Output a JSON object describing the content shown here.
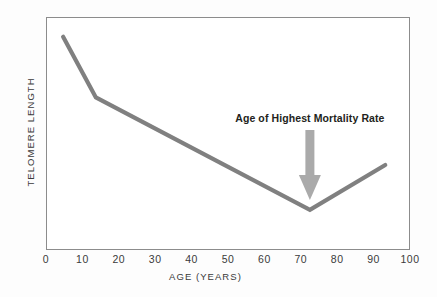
{
  "chart_data": {
    "type": "line",
    "title": "",
    "xlabel": "AGE (YEARS)",
    "ylabel": "TELOMERE LENGTH",
    "xlim": [
      0,
      100
    ],
    "ylim": [
      0,
      1
    ],
    "grid": false,
    "legend": false,
    "xticks": [
      "0",
      "10",
      "20",
      "30",
      "40",
      "50",
      "60",
      "70",
      "80",
      "90",
      "100"
    ],
    "xtick_values": [
      0,
      10,
      20,
      30,
      40,
      50,
      60,
      70,
      80,
      90,
      100
    ],
    "yticks": [],
    "series": [
      {
        "name": "Telomere length",
        "color": "#808080",
        "x": [
          4.7,
          13.7,
          72.5,
          93.2
        ],
        "y": [
          0.915,
          0.655,
          0.172,
          0.365
        ]
      }
    ],
    "annotations": [
      {
        "name": "mortality-annotation",
        "text": "Age of Highest Mortality Rate",
        "x": 72.5,
        "arrow": "down",
        "arrow_color": "#aaaaaa",
        "text_color": "#231f20"
      }
    ],
    "colors": {
      "line": "#808080",
      "arrow": "#aaaaaa",
      "frame": "#8c8c8c",
      "text": "#3a3a3a",
      "background": "#ffffff"
    }
  }
}
